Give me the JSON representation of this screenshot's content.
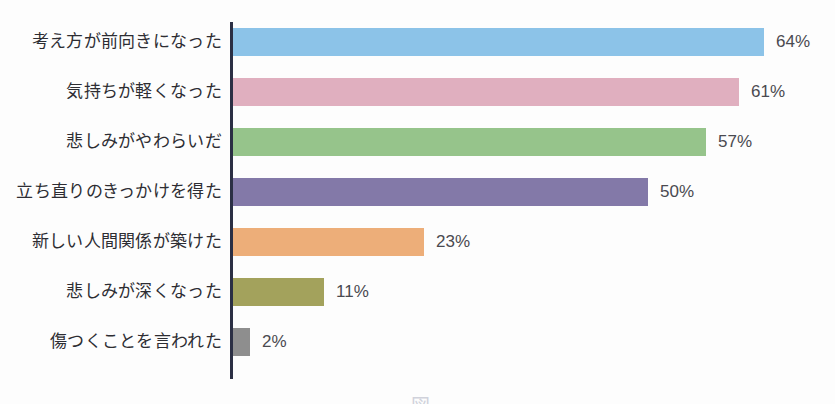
{
  "chart_data": {
    "type": "bar",
    "orientation": "horizontal",
    "title": "",
    "xlabel": "",
    "ylabel": "",
    "xlim": [
      0,
      72
    ],
    "grid": false,
    "legend": false,
    "axis_color": "#2b2f44",
    "background": "#fdfdfd",
    "value_suffix": "%",
    "categories": [
      "考え方が前向きになった",
      "気持ちが軽くなった",
      "悲しみがやわらいだ",
      "立ち直りのきっかけを得た",
      "新しい人間関係が築けた",
      "悲しみが深くなった",
      "傷つくことを言われた"
    ],
    "values": [
      64,
      61,
      57,
      50,
      23,
      11,
      2
    ],
    "value_labels": [
      "64%",
      "61%",
      "57%",
      "50%",
      "23%",
      "11%",
      "2%"
    ],
    "colors": [
      "#8cc3e8",
      "#e0afbf",
      "#96c48b",
      "#8379a8",
      "#edae79",
      "#a3a25c",
      "#8e8e8e"
    ],
    "bars": [
      {
        "label": "考え方が前向きになった",
        "value": 64,
        "value_label": "64%",
        "color": "#8cc3e8"
      },
      {
        "label": "気持ちが軽くなった",
        "value": 61,
        "value_label": "61%",
        "color": "#e0afbf"
      },
      {
        "label": "悲しみがやわらいだ",
        "value": 57,
        "value_label": "57%",
        "color": "#96c48b"
      },
      {
        "label": "立ち直りのきっかけを得た",
        "value": 50,
        "value_label": "50%",
        "color": "#8379a8"
      },
      {
        "label": "新しい人間関係が築けた",
        "value": 23,
        "value_label": "23%",
        "color": "#edae79"
      },
      {
        "label": "悲しみが深くなった",
        "value": 11,
        "value_label": "11%",
        "color": "#a3a25c"
      },
      {
        "label": "傷つくことを言われた",
        "value": 2,
        "value_label": "2%",
        "color": "#8e8e8e"
      }
    ]
  },
  "caption": {
    "partial_text": "図"
  }
}
